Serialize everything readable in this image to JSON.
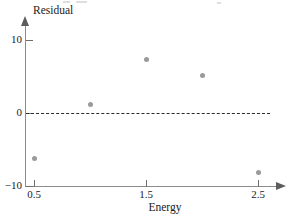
{
  "chart_data": {
    "type": "scatter",
    "title": "",
    "xlabel": "Energy",
    "ylabel": "Residual",
    "xlim": [
      0.25,
      2.75
    ],
    "ylim": [
      -11,
      11.5
    ],
    "grid": false,
    "legend": null,
    "reference_line": {
      "name": "zero-residual-line",
      "y": 0,
      "style": "dashed",
      "color": "#2b2b2b"
    },
    "xticks": [
      {
        "value": 0.5,
        "label": "0.5"
      },
      {
        "value": 1.5,
        "label": "1.5"
      },
      {
        "value": 2.5,
        "label": "2.5"
      }
    ],
    "yticks": [
      {
        "value": 10,
        "label": "10"
      },
      {
        "value": 0,
        "label": "0"
      },
      {
        "value": -10,
        "label": "−10"
      }
    ],
    "marker": {
      "shape": "circle",
      "color": "#9a9a9a",
      "size_px": 5
    },
    "x": [
      0.5,
      1.0,
      1.5,
      2.0,
      2.5
    ],
    "y": [
      -6.3,
      1.2,
      7.3,
      5.1,
      -8.2
    ],
    "points": [
      {
        "x": 0.5,
        "y": -6.3
      },
      {
        "x": 1.0,
        "y": 1.2
      },
      {
        "x": 1.5,
        "y": 7.3
      },
      {
        "x": 2.0,
        "y": 5.1
      },
      {
        "x": 2.5,
        "y": -8.2
      }
    ]
  },
  "axes": {
    "y_title": "Residual",
    "x_title": "Energy",
    "y_arrow": "arrow-up",
    "x_arrow": "arrow-right"
  },
  "colors": {
    "axis": "#8c8c8c",
    "marker": "#9a9a9a",
    "reference_line": "#2b2b2b",
    "text": "#1a1a1a",
    "background": "#ffffff"
  }
}
